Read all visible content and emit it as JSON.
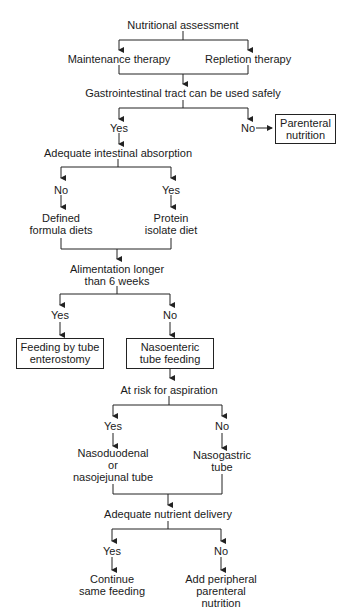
{
  "diagram": {
    "type": "flowchart",
    "nodes": {
      "nutritional_assessment": "Nutritional assessment",
      "maintenance_therapy": "Maintenance therapy",
      "repletion_therapy": "Repletion therapy",
      "gi_tract_safe": "Gastrointestinal tract can be used safely",
      "gi_yes": "Yes",
      "gi_no": "No",
      "parenteral_nutrition_1": "Parenteral",
      "parenteral_nutrition_2": "nutrition",
      "adequate_absorption": "Adequate intestinal absorption",
      "abs_no": "No",
      "abs_yes": "Yes",
      "defined_formula_1": "Defined",
      "defined_formula_2": "formula diets",
      "protein_isolate_1": "Protein",
      "protein_isolate_2": "isolate diet",
      "alimentation_1": "Alimentation longer",
      "alimentation_2": "than 6 weeks",
      "alim_yes": "Yes",
      "alim_no": "No",
      "enterostomy_1": "Feeding by tube",
      "enterostomy_2": "enterostomy",
      "nasoenteric_1": "Nasoenteric",
      "nasoenteric_2": "tube feeding",
      "aspiration_risk": "At risk for aspiration",
      "asp_yes": "Yes",
      "asp_no": "No",
      "nasoduodenal_1": "Nasoduodenal",
      "nasoduodenal_2": "or",
      "nasoduodenal_3": "nasojejunal tube",
      "nasogastric_1": "Nasogastric",
      "nasogastric_2": "tube",
      "adequate_delivery": "Adequate nutrient delivery",
      "del_yes": "Yes",
      "del_no": "No",
      "continue_1": "Continue",
      "continue_2": "same feeding",
      "add_peripheral_1": "Add peripheral",
      "add_peripheral_2": "parenteral",
      "add_peripheral_3": "nutrition"
    }
  }
}
